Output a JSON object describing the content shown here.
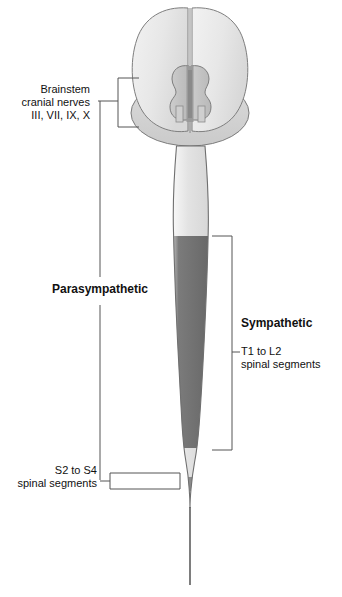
{
  "figure": {
    "background": "#ffffff"
  },
  "labels": {
    "brainstem": "Brainstem\ncranial nerves\nIII, VII, IX, X",
    "parasympathetic": "Parasympathetic",
    "sympathetic": "Sympathetic",
    "sympathetic_segments": "T1 to L2\nspinal segments",
    "sacral_segments": "S2 to S4\nspinal segments"
  },
  "anatomy": {
    "cerebrum_label": "cerebral-hemispheres",
    "cerebellum_label": "cerebellum",
    "brainstem_nuclei_label": "brainstem-nuclei",
    "cord_cervical_label": "cervical-cord",
    "cord_thoracolumbar_label": "thoracolumbar-cord",
    "cord_lumbar_light_label": "lumbar-cord",
    "cord_sacral_label": "sacral-cord",
    "filum_label": "filum-terminale"
  },
  "colors": {
    "outline": "#6b6b6b",
    "cerebrum_fill": "#e9e9e9",
    "cerebellum_fill": "#d3d3d3",
    "nuclei_fill": "#c6c6c6",
    "nuclei_stripe": "#8d8d8d",
    "cord_light": "#dedede",
    "cord_dark": "#6e6e6e",
    "cord_sacral": "#8a8a8a",
    "highlight": "#fbfbfb",
    "bracket": "#555555",
    "text": "#111111"
  },
  "brackets": {
    "brainstem_bracket": "brainstem-cranial-nerve-bracket",
    "parasympathetic_line": "parasympathetic-span-line",
    "sympathetic_bracket": "sympathetic-span-bracket",
    "sacral_bracket": "sacral-outflow-bracket"
  }
}
